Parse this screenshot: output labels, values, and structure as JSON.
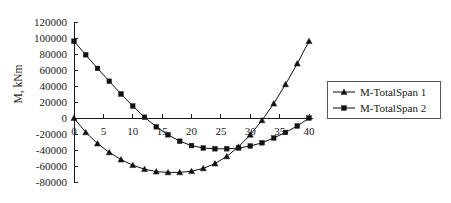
{
  "chart_data": {
    "type": "line",
    "title": "",
    "subtitle": "",
    "xlabel": "",
    "ylabel": "M, kNm",
    "xlim": [
      0,
      40
    ],
    "ylim": [
      -80000,
      120000
    ],
    "xticks": [
      0,
      5,
      10,
      15,
      20,
      25,
      30,
      35,
      40
    ],
    "xtick_labels": [
      "0",
      "5",
      "10",
      "15",
      "20",
      "25",
      "30",
      "35",
      "40"
    ],
    "yticks": [
      -80000,
      -60000,
      -40000,
      -20000,
      0,
      20000,
      40000,
      60000,
      80000,
      100000,
      120000
    ],
    "ytick_labels": [
      "-80000",
      "-60000",
      "-40000",
      "-20000",
      "0",
      "20000",
      "40000",
      "60000",
      "80000",
      "100000",
      "120000"
    ],
    "grid": false,
    "legend_position": "right",
    "x": [
      0,
      2,
      4,
      6,
      8,
      10,
      12,
      14,
      16,
      18,
      20,
      22,
      24,
      26,
      28,
      30,
      32,
      34,
      36,
      38,
      40
    ],
    "series": [
      {
        "name": "M-TotalSpan 1",
        "marker": "triangle",
        "color": "#111111",
        "values": [
          0,
          -18000,
          -32000,
          -43000,
          -52000,
          -59000,
          -64000,
          -67000,
          -68000,
          -68000,
          -66500,
          -63000,
          -57000,
          -48000,
          -36000,
          -21000,
          -3000,
          18000,
          42000,
          68000,
          96000
        ]
      },
      {
        "name": "M-TotalSpan 2",
        "marker": "square",
        "color": "#111111",
        "values": [
          96000,
          79000,
          62000,
          46000,
          30000,
          15000,
          1000,
          -11000,
          -21000,
          -29000,
          -34500,
          -37500,
          -38500,
          -38500,
          -37500,
          -35000,
          -31000,
          -25000,
          -18000,
          -10000,
          0
        ]
      }
    ]
  },
  "legend": {
    "items": [
      {
        "label": "M-TotalSpan 1",
        "marker": "triangle"
      },
      {
        "label": "M-TotalSpan 2",
        "marker": "square"
      }
    ]
  }
}
